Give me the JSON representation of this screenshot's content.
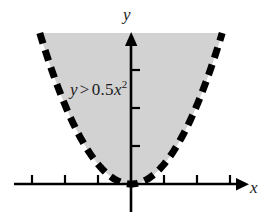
{
  "figure": {
    "kind": "coordinate-plane-inequality-graph",
    "background_color": "#ffffff",
    "ink_color": "#000000",
    "shade_color": "#d2d2d2",
    "width": 266,
    "height": 223
  },
  "axes": {
    "x_label": "x",
    "y_label": "y",
    "origin": {
      "x": 131,
      "y": 184
    },
    "x_axis": {
      "y_pixel": 184,
      "start_x": 14,
      "end_x": 248,
      "arrow": "right",
      "tick_spacing_px": 33,
      "tick_length_px": 9,
      "tick_positions_px": [
        32,
        65,
        98,
        131,
        164,
        197,
        230
      ],
      "tick_labels": []
    },
    "y_axis": {
      "x_pixel": 131,
      "start_y": 210,
      "end_y": 33,
      "arrow": "up",
      "tick_spacing_px": 38,
      "tick_length_px": 8,
      "tick_positions_px": [
        146,
        108,
        70
      ],
      "tick_labels": []
    }
  },
  "chart_data": {
    "type": "line",
    "title": "",
    "xlabel": "x",
    "ylabel": "y",
    "grid": false,
    "legend": null,
    "annotations": [
      {
        "name": "inequality-label",
        "text": "y > 0.5x²",
        "parts": {
          "lhs": "y",
          "operator": ">",
          "coefficient": "0.5",
          "variable": "x",
          "exponent": "2"
        },
        "x_px": 70,
        "y_px": 80
      }
    ],
    "series": [
      {
        "name": "boundary parabola y = 0.5x^2",
        "equation": "y = 0.5x^2",
        "style": "dashed",
        "line_width_px": 7,
        "color": "#000000",
        "included_in_solution": false,
        "vertex": {
          "x": 0,
          "y": 0
        },
        "x": [
          -3.0,
          -2.5,
          -2.0,
          -1.5,
          -1.0,
          -0.5,
          0.0,
          0.5,
          1.0,
          1.5,
          2.0,
          2.5,
          3.0
        ],
        "values": [
          4.5,
          3.125,
          2.0,
          1.125,
          0.5,
          0.125,
          0.0,
          0.125,
          0.5,
          1.125,
          2.0,
          3.125,
          4.5
        ]
      }
    ],
    "shaded_region": {
      "description": "region above the dashed parabola",
      "inequality": "y > 0.5x^2",
      "fill": "#d2d2d2",
      "boundary_dashed": true
    },
    "xlim": [
      -3.6,
      3.6
    ],
    "ylim": [
      -0.8,
      4.6
    ]
  }
}
